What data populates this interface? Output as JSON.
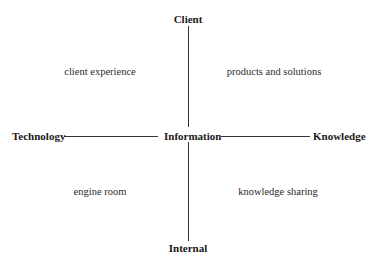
{
  "diagram": {
    "type": "quadrant",
    "axes": {
      "top": "Client",
      "bottom": "Internal",
      "left": "Technology",
      "right": "Knowledge",
      "center": "Information"
    },
    "quadrants": {
      "top_left": "client experience",
      "top_right": "products and solutions",
      "bottom_left": "engine room",
      "bottom_right": "knowledge sharing"
    },
    "colors": {
      "text": "#1a1a1a",
      "lines": "#333333",
      "background": "#ffffff"
    }
  }
}
